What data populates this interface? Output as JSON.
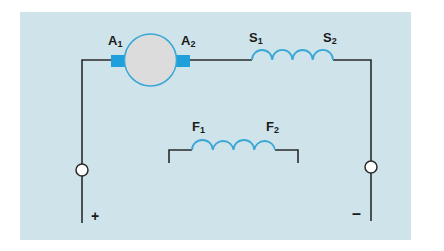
{
  "diagram": {
    "type": "dc-compound-motor-circuit",
    "colors": {
      "background": "#ffffff",
      "panel": "#cfe3ea",
      "wire": "#2a2a2a",
      "coil": "#3aa7d6",
      "armature_fill": "#dcdcdc",
      "armature_stroke": "#3aa7d6",
      "brush": "#1fa0dc",
      "terminal_fill": "#ffffff"
    },
    "armature": {
      "left_terminal": {
        "main": "A",
        "sub": "1"
      },
      "right_terminal": {
        "main": "A",
        "sub": "2"
      }
    },
    "series_field": {
      "left_terminal": {
        "main": "S",
        "sub": "1"
      },
      "right_terminal": {
        "main": "S",
        "sub": "2"
      },
      "turns": 4
    },
    "shunt_field": {
      "left_terminal": {
        "main": "F",
        "sub": "1"
      },
      "right_terminal": {
        "main": "F",
        "sub": "2"
      },
      "turns": 4
    },
    "supply": {
      "positive_label": "+",
      "negative_label": "–"
    }
  }
}
